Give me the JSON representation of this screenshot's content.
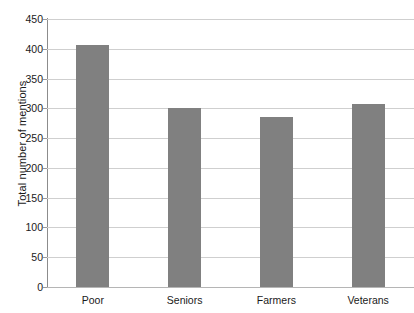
{
  "chart_data": {
    "type": "bar",
    "title": "",
    "subtitle": "",
    "xlabel": "",
    "ylabel": "Total number of mentions",
    "categories": [
      "Poor",
      "Seniors",
      "Farmers",
      "Veterans"
    ],
    "values": [
      407,
      300,
      285,
      307
    ],
    "series": [
      {
        "name": "Total number of mentions",
        "values": [
          407,
          300,
          285,
          307
        ]
      }
    ],
    "ylim": [
      0,
      450
    ],
    "yticks": [
      0,
      50,
      100,
      150,
      200,
      250,
      300,
      350,
      400,
      450
    ],
    "ytick_labels": [
      "0",
      "50",
      "100",
      "150",
      "200",
      "250",
      "300",
      "350",
      "400",
      "450"
    ],
    "grid": true,
    "grid_axis": "y",
    "legend": false,
    "legend_position": "none",
    "bar_color": "#808080",
    "grid_color": "#cfcfcf",
    "axis_color": "#8c8c8c",
    "background_color": "#ffffff",
    "text_color": "#1a1a1a",
    "annotations": []
  }
}
